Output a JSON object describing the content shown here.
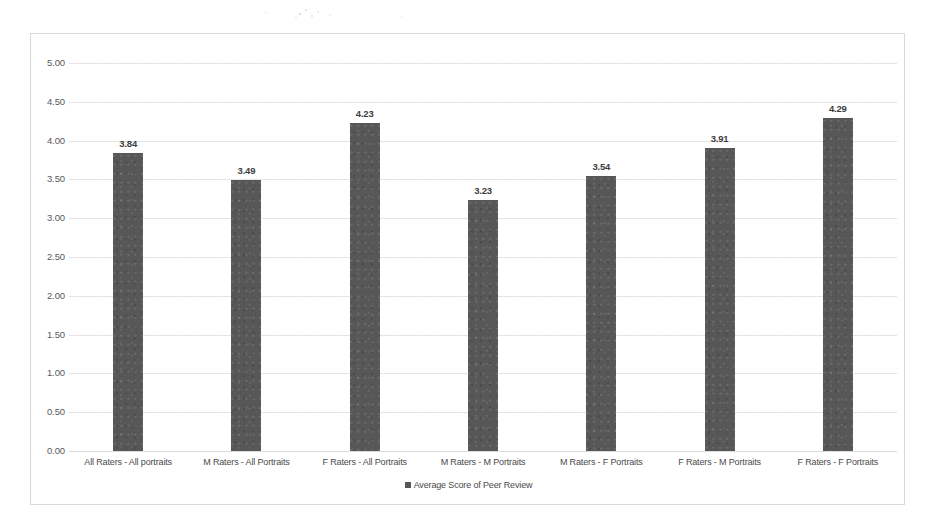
{
  "chart_data": {
    "type": "bar",
    "title": "",
    "subtitle": "",
    "xlabel": "",
    "ylabel": "",
    "ylim": [
      0,
      5
    ],
    "ytick_step": 0.5,
    "yticks": [
      "0.00",
      "0.50",
      "1.00",
      "1.50",
      "2.00",
      "2.50",
      "3.00",
      "3.50",
      "4.00",
      "4.50",
      "5.00"
    ],
    "grid": true,
    "legend_position": "bottom",
    "legend": [
      "Average Score of Peer Review"
    ],
    "series_name": "Average Score of Peer Review",
    "categories": [
      "All Raters - All portraits",
      "M Raters - All Portraits",
      "F Raters - All Portraits",
      "M Raters - M Portraits",
      "M Raters - F Portraits",
      "F Raters - M Portraits",
      "F Raters - F Portraits"
    ],
    "values": [
      3.84,
      3.49,
      4.23,
      3.23,
      3.54,
      3.91,
      4.29
    ],
    "data_labels": [
      "3.84",
      "3.49",
      "4.23",
      "3.23",
      "3.54",
      "3.91",
      "4.29"
    ],
    "bar_color": "#575757",
    "gridline_color": "#e8e8e8",
    "border_color": "#d9d9d9",
    "text_color": "#4a4a4a"
  }
}
